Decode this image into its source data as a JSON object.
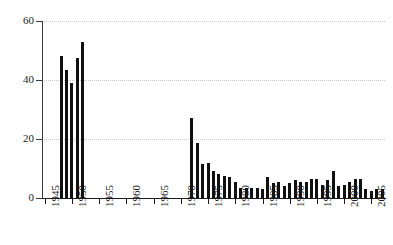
{
  "chart_data": {
    "type": "bar",
    "title": "",
    "subtitle": "",
    "xlabel": "",
    "ylabel": "",
    "xlim": [
      1944.5,
      2007.5
    ],
    "ylim": [
      0,
      60
    ],
    "yticks": [
      0,
      20,
      40,
      60
    ],
    "xticks": [
      1945,
      1950,
      1955,
      1960,
      1965,
      1970,
      1975,
      1980,
      1985,
      1990,
      1995,
      2000,
      2005
    ],
    "xtick_labels": [
      "1945",
      "1950",
      "1955",
      "1960",
      "1965",
      "1970",
      "1975",
      "1980",
      "1985",
      "1990",
      "1995",
      "2000",
      "2005"
    ],
    "xtick_rotation": 90,
    "grid": "horizontal-dotted",
    "legend": "none",
    "bar_color": "#111111",
    "categories": [
      1945,
      1946,
      1947,
      1948,
      1949,
      1950,
      1951,
      1952,
      1953,
      1954,
      1955,
      1956,
      1957,
      1958,
      1959,
      1960,
      1961,
      1962,
      1963,
      1964,
      1965,
      1966,
      1967,
      1968,
      1969,
      1970,
      1971,
      1972,
      1973,
      1974,
      1975,
      1976,
      1977,
      1978,
      1979,
      1980,
      1981,
      1982,
      1983,
      1984,
      1985,
      1986,
      1987,
      1988,
      1989,
      1990,
      1991,
      1992,
      1993,
      1994,
      1995,
      1996,
      1997,
      1998,
      1999,
      2000,
      2001,
      2002,
      2003,
      2004,
      2005,
      2006,
      2007
    ],
    "values": [
      0,
      0,
      0,
      48,
      43.5,
      39,
      47.5,
      53,
      0,
      0,
      0,
      0,
      0,
      0,
      0,
      0,
      0,
      0,
      0,
      0,
      0,
      0,
      0,
      0,
      0,
      0,
      0,
      27,
      18.5,
      11.5,
      12,
      9,
      8,
      7.5,
      7,
      5.5,
      3.5,
      3.5,
      3.5,
      3.5,
      3,
      7,
      5,
      5.5,
      4,
      5,
      6,
      5.5,
      5.5,
      6.5,
      6.5,
      4.5,
      6,
      9,
      4,
      4.5,
      5.5,
      6.5,
      6.5,
      3,
      2.5,
      3,
      3
    ]
  }
}
